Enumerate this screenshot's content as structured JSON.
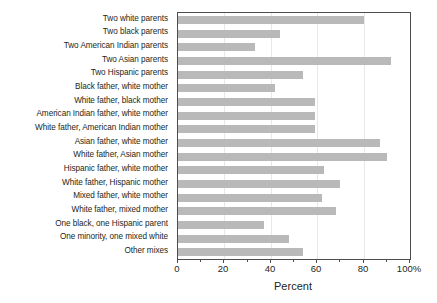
{
  "chart_data": {
    "type": "bar",
    "orientation": "horizontal",
    "title": "",
    "xlabel": "Percent",
    "ylabel": "",
    "xlim": [
      0,
      100
    ],
    "grid": true,
    "legend": null,
    "categories": [
      "Two white parents",
      "Two black parents",
      "Two American Indian parents",
      "Two Asian parents",
      "Two Hispanic parents",
      "Black father, white mother",
      "White father, black mother",
      "American Indian father, white mother",
      "White father, American Indian mother",
      "Asian father, white mother",
      "White father, Asian mother",
      "Hispanic father, white mother",
      "White father, Hispanic mother",
      "Mixed father, white mother",
      "White father, mixed mother",
      "One black, one Hispanic parent",
      "One minority, one mixed white",
      "Other mixes"
    ],
    "values": [
      80,
      44,
      33,
      92,
      54,
      42,
      59,
      59,
      59,
      87,
      90,
      63,
      70,
      62,
      68,
      37,
      48,
      54
    ],
    "xticks": [
      0,
      20,
      40,
      60,
      80,
      100
    ],
    "xtick_labels": [
      "0",
      "20",
      "40",
      "60",
      "80",
      "100%"
    ],
    "xticks_minor": [
      10,
      30,
      50,
      70,
      90
    ],
    "bar_color": "#b9b9b9",
    "axis_color": "#4d4d4d",
    "grid_color": "#e8e8e8"
  }
}
